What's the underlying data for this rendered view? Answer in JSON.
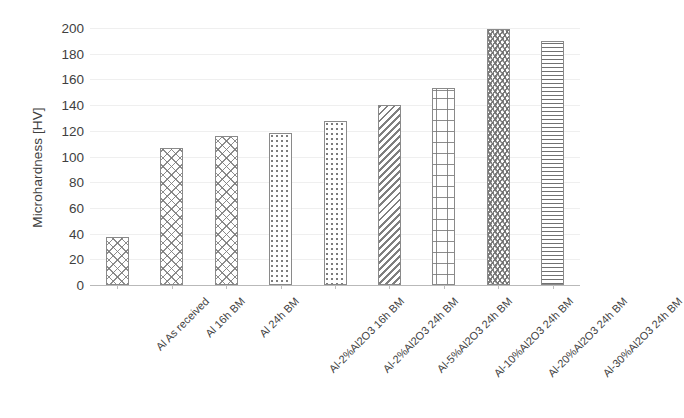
{
  "chart_data": {
    "type": "bar",
    "title": "",
    "xlabel": "",
    "ylabel": "Microhardness [HV]",
    "ylim": [
      0,
      200
    ],
    "ytick_step": 20,
    "yticks": [
      200,
      180,
      160,
      140,
      120,
      100,
      80,
      60,
      40,
      20,
      0
    ],
    "grid": true,
    "grid_axis": "y",
    "legend": false,
    "categories": [
      "Al As received",
      "Al 16h BM",
      "Al 24h BM",
      "Al-2%Al2O3 16h BM",
      "Al-2%Al2O3 24h BM",
      "Al-5%Al2O3 24h BM",
      "Al-10%Al2O3 24h BM",
      "Al-20%Al2O3 24h BM",
      "Al-30%Al2O3 24h BM"
    ],
    "values": [
      37,
      107,
      116,
      118,
      128,
      140,
      153,
      199,
      190
    ],
    "bar_patterns": [
      "crosshatch",
      "crosshatch",
      "crosshatch",
      "dots",
      "dots",
      "diagonal",
      "squares",
      "zigzag",
      "horizontal-lines"
    ],
    "bar_edge_color": "#8a8a8a",
    "bar_fill_color": "#ffffff",
    "gridline_color": "#efefef",
    "axis_color": "#b9b9b9",
    "text_color": "#3f3f3f"
  }
}
